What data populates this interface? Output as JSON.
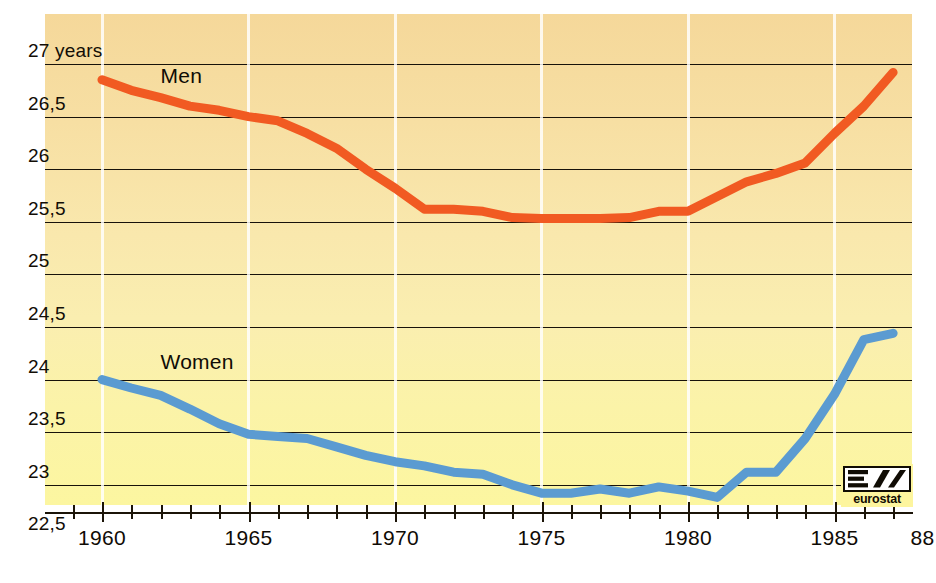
{
  "chart_data": {
    "type": "line",
    "title": "",
    "xlabel": "",
    "ylabel": "",
    "xlim": [
      1959.3,
      1988.0
    ],
    "ylim": [
      22.5,
      27.18
    ],
    "grid": "horizontal-black-and-vertical-white",
    "legend": "inline-labels",
    "y_ticks": [
      "27 years",
      "26,5",
      "26",
      "25,5",
      "25",
      "24,5",
      "24",
      "23,5",
      "23",
      "22,5"
    ],
    "y_tick_values": [
      27,
      26.5,
      26,
      25.5,
      25,
      24.5,
      24,
      23.5,
      23,
      22.5
    ],
    "x_ticks": [
      "1960",
      "1965",
      "1970",
      "1975",
      "1980",
      "1985",
      "88"
    ],
    "x_tick_values": [
      1960,
      1965,
      1970,
      1975,
      1980,
      1985,
      1988
    ],
    "x_minor_ticks": [
      1959,
      1960,
      1961,
      1962,
      1963,
      1964,
      1965,
      1966,
      1967,
      1968,
      1969,
      1970,
      1971,
      1972,
      1973,
      1974,
      1975,
      1976,
      1977,
      1978,
      1979,
      1980,
      1981,
      1982,
      1983,
      1984,
      1985,
      1986,
      1987,
      1988
    ],
    "x": [
      1960,
      1961,
      1962,
      1963,
      1964,
      1965,
      1966,
      1967,
      1968,
      1969,
      1970,
      1971,
      1972,
      1973,
      1974,
      1975,
      1976,
      1977,
      1978,
      1979,
      1980,
      1981,
      1982,
      1983,
      1984,
      1985,
      1986,
      1987
    ],
    "series": [
      {
        "name": "Men",
        "color": "#f15a22",
        "label_x": 1962.0,
        "label_y": 26.78,
        "values": [
          26.85,
          26.75,
          26.68,
          26.6,
          26.56,
          26.5,
          26.46,
          26.34,
          26.2,
          26.0,
          25.82,
          25.62,
          25.62,
          25.6,
          25.54,
          25.53,
          25.53,
          25.53,
          25.54,
          25.6,
          25.6,
          25.74,
          25.88,
          25.96,
          26.06,
          26.34,
          26.6,
          26.92
        ]
      },
      {
        "name": "Women",
        "color": "#5b9bd1",
        "label_x": 1962.0,
        "label_y": 24.06,
        "values": [
          24.0,
          23.92,
          23.85,
          23.72,
          23.58,
          23.48,
          23.46,
          23.44,
          23.36,
          23.28,
          23.22,
          23.18,
          23.12,
          23.1,
          23.0,
          22.92,
          22.92,
          22.96,
          22.92,
          22.98,
          22.94,
          22.88,
          23.12,
          23.12,
          23.44,
          23.86,
          24.38,
          24.44
        ]
      }
    ]
  },
  "logo": {
    "mark": "eurostat-e-mark",
    "word": "eurostat"
  }
}
